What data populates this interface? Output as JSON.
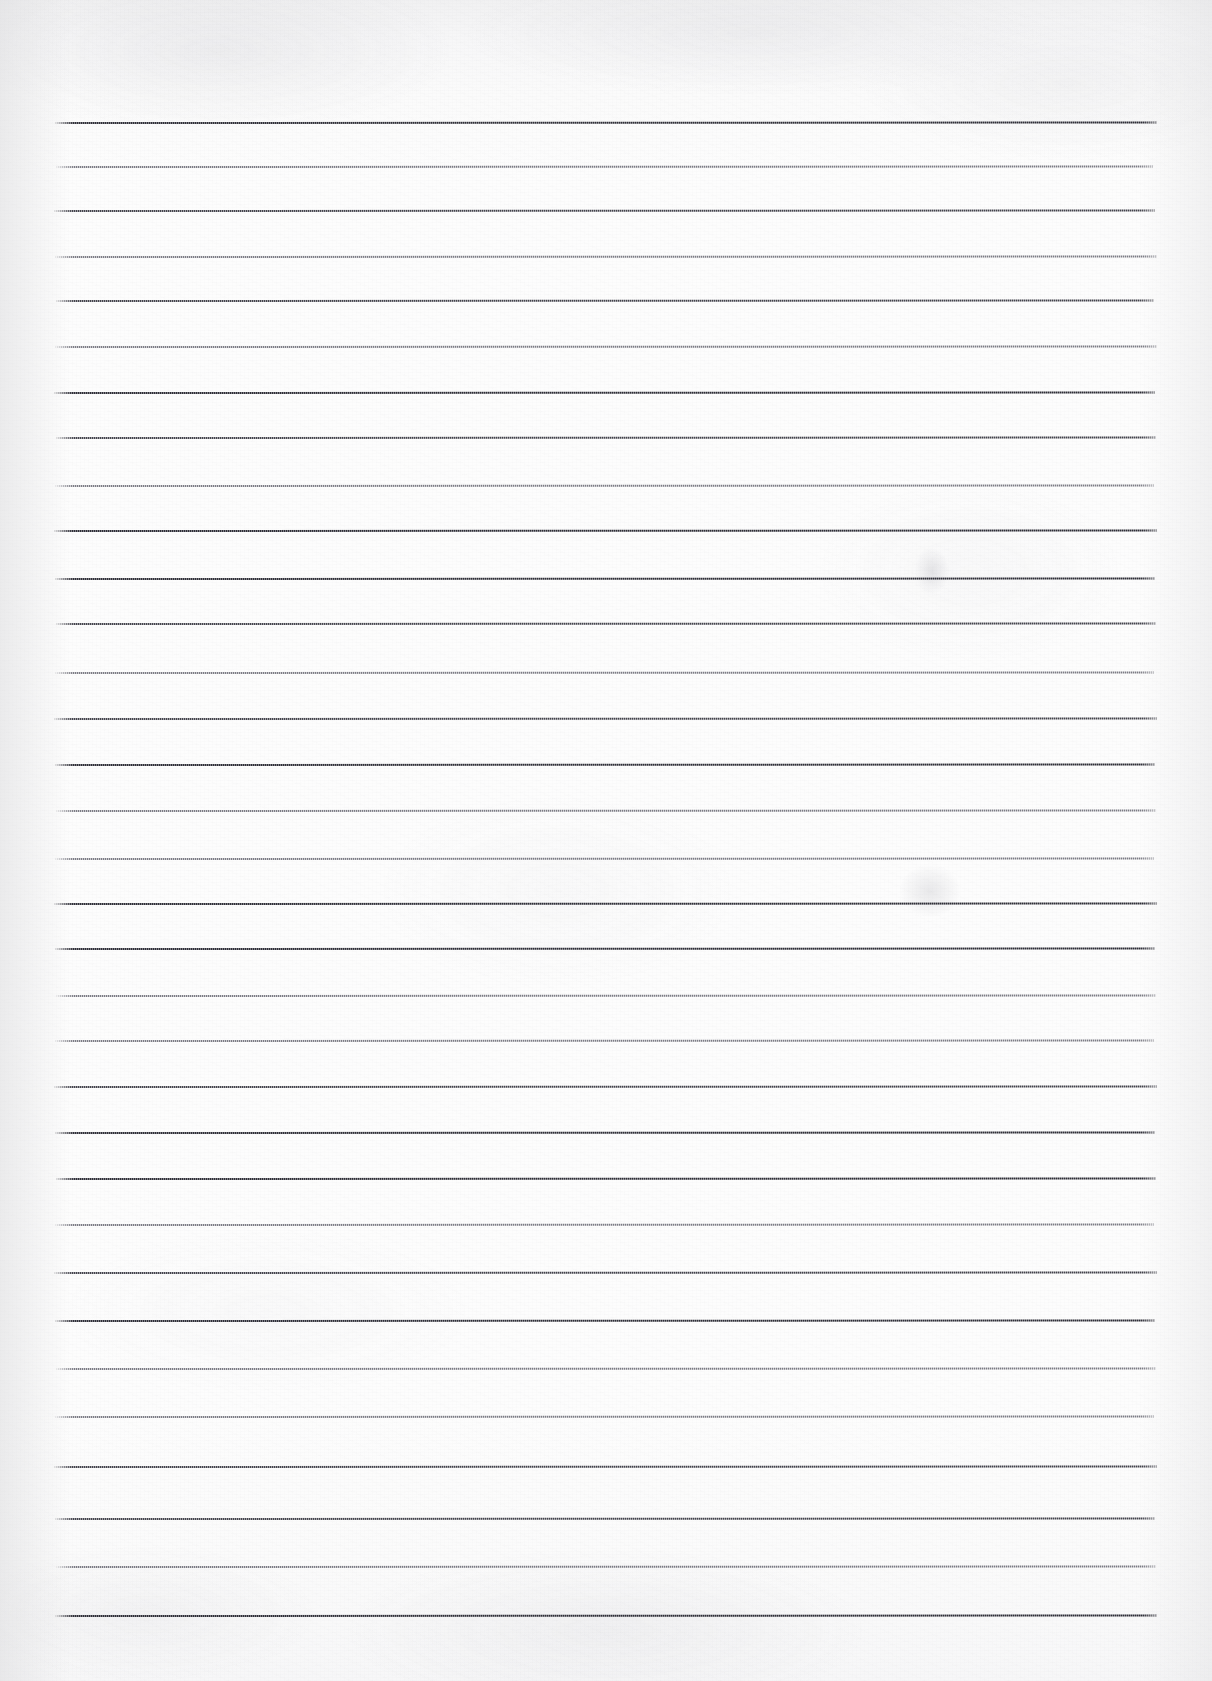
{
  "document": {
    "kind": "scanned-lined-paper",
    "title": "Blank ruled notebook page (scan)",
    "page_width": 1212,
    "page_height": 1681,
    "background_color": "#fdfdfd",
    "has_text": false,
    "has_handwriting": false,
    "has_margin_rule": false,
    "has_punch_holes": false,
    "visible_text": ""
  },
  "ruling": {
    "ink_color": "#3a3a42",
    "line_thickness_px": 2,
    "line_start_x": 57,
    "line_end_x": 1157,
    "first_line_y": 122,
    "last_line_y": 1615,
    "line_count": 32,
    "average_spacing_px": 48,
    "lines": [
      {
        "y": 122,
        "x1": 55,
        "x2": 1157,
        "weight": "dark",
        "skew": -0.45
      },
      {
        "y": 166,
        "x1": 56,
        "x2": 1153,
        "weight": "light",
        "skew": -0.4
      },
      {
        "y": 210,
        "x1": 54,
        "x2": 1155,
        "weight": "normal",
        "skew": -0.45
      },
      {
        "y": 256,
        "x1": 55,
        "x2": 1157,
        "weight": "light",
        "skew": -0.4
      },
      {
        "y": 300,
        "x1": 56,
        "x2": 1154,
        "weight": "normal",
        "skew": -0.45
      },
      {
        "y": 346,
        "x1": 55,
        "x2": 1157,
        "weight": "light",
        "skew": -0.4
      },
      {
        "y": 392,
        "x1": 54,
        "x2": 1155,
        "weight": "dark",
        "skew": -0.45
      },
      {
        "y": 437,
        "x1": 56,
        "x2": 1156,
        "weight": "normal",
        "skew": -0.42
      },
      {
        "y": 485,
        "x1": 55,
        "x2": 1154,
        "weight": "light",
        "skew": -0.4
      },
      {
        "y": 530,
        "x1": 54,
        "x2": 1157,
        "weight": "dark",
        "skew": -0.45
      },
      {
        "y": 578,
        "x1": 55,
        "x2": 1155,
        "weight": "dark",
        "skew": -0.42
      },
      {
        "y": 623,
        "x1": 56,
        "x2": 1156,
        "weight": "normal",
        "skew": -0.4
      },
      {
        "y": 672,
        "x1": 55,
        "x2": 1154,
        "weight": "light",
        "skew": -0.45
      },
      {
        "y": 718,
        "x1": 54,
        "x2": 1157,
        "weight": "normal",
        "skew": -0.42
      },
      {
        "y": 764,
        "x1": 55,
        "x2": 1155,
        "weight": "dark",
        "skew": -0.4
      },
      {
        "y": 810,
        "x1": 56,
        "x2": 1156,
        "weight": "light",
        "skew": -0.45
      },
      {
        "y": 858,
        "x1": 55,
        "x2": 1154,
        "weight": "light",
        "skew": -0.42
      },
      {
        "y": 903,
        "x1": 54,
        "x2": 1157,
        "weight": "dark",
        "skew": -0.4
      },
      {
        "y": 948,
        "x1": 55,
        "x2": 1155,
        "weight": "dark",
        "skew": -0.45
      },
      {
        "y": 995,
        "x1": 56,
        "x2": 1156,
        "weight": "light",
        "skew": -0.42
      },
      {
        "y": 1040,
        "x1": 55,
        "x2": 1154,
        "weight": "light",
        "skew": -0.4
      },
      {
        "y": 1086,
        "x1": 54,
        "x2": 1157,
        "weight": "normal",
        "skew": -0.45
      },
      {
        "y": 1132,
        "x1": 55,
        "x2": 1155,
        "weight": "dark",
        "skew": -0.42
      },
      {
        "y": 1178,
        "x1": 56,
        "x2": 1156,
        "weight": "dark",
        "skew": -0.4
      },
      {
        "y": 1224,
        "x1": 55,
        "x2": 1154,
        "weight": "light",
        "skew": -0.45
      },
      {
        "y": 1272,
        "x1": 54,
        "x2": 1157,
        "weight": "normal",
        "skew": -0.42
      },
      {
        "y": 1320,
        "x1": 55,
        "x2": 1155,
        "weight": "dark",
        "skew": -0.4
      },
      {
        "y": 1368,
        "x1": 56,
        "x2": 1156,
        "weight": "light",
        "skew": -0.45
      },
      {
        "y": 1416,
        "x1": 55,
        "x2": 1154,
        "weight": "light",
        "skew": -0.42
      },
      {
        "y": 1466,
        "x1": 54,
        "x2": 1157,
        "weight": "normal",
        "skew": -0.4
      },
      {
        "y": 1518,
        "x1": 55,
        "x2": 1155,
        "weight": "normal",
        "skew": -0.45
      },
      {
        "y": 1566,
        "x1": 56,
        "x2": 1156,
        "weight": "light",
        "skew": -0.42
      },
      {
        "y": 1615,
        "x1": 55,
        "x2": 1157,
        "weight": "dark",
        "skew": -0.4
      }
    ]
  },
  "artifacts": {
    "smudges": [
      {
        "name": "smudge-right-upper",
        "x": 915,
        "y": 548,
        "w": 34,
        "h": 46
      },
      {
        "name": "smudge-right-middle",
        "x": 900,
        "y": 865,
        "w": 60,
        "h": 52
      }
    ],
    "top_edge_shadow": true,
    "bottom_edge_shadow": true
  }
}
